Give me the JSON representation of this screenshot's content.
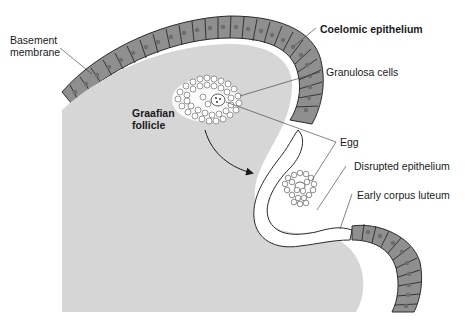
{
  "diagram": {
    "colors": {
      "ovary_stroma": "#d6d6d6",
      "epithelium_fill": "#8f8f8f",
      "epithelium_line": "#2a2a2a",
      "nucleus": "#6e6e6e",
      "follicle_cells": "#ffffff",
      "background": "#ffffff",
      "label_text": "#1a1a1a"
    },
    "labels": {
      "basement_membrane_1": "Basement",
      "basement_membrane_2": "membrane",
      "coelomic_epithelium": "Coelomic epithelium",
      "granulosa_cells": "Granulosa cells",
      "graafian_follicle_1": "Graafian",
      "graafian_follicle_2": "follicle",
      "egg": "Egg",
      "disrupted_epithelium": "Disrupted epithelium",
      "early_corpus_luteum": "Early corpus luteum"
    },
    "structures": [
      "Coelomic epithelium (cuboidal cell layer with nuclei)",
      "Basement membrane",
      "Ovary stroma",
      "Graafian follicle with granulosa cells and egg",
      "Arrow indicating follicle migration/rupture",
      "Ruptured follicle releasing egg with surrounding cells",
      "Disrupted epithelium",
      "Early corpus luteum"
    ]
  }
}
